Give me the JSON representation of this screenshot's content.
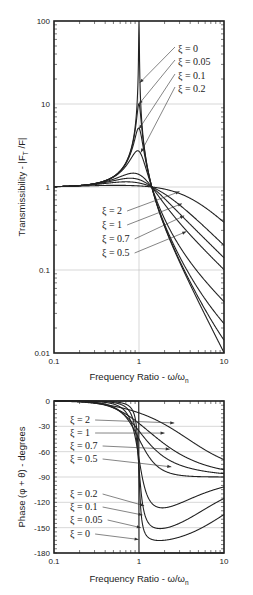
{
  "chart_data": [
    {
      "type": "line",
      "title": "",
      "xlabel": "Frequency Ratio - ω/ω",
      "xlabel_sub": "n",
      "ylabel": "Transmissibility - |F",
      "ylabel_sub": "T",
      "ylabel_tail": " /F|",
      "xscale": "log",
      "yscale": "log",
      "xlim": [
        0.1,
        10
      ],
      "ylim": [
        0.01,
        100
      ],
      "x_ticks": [
        0.1,
        1,
        10
      ],
      "x_tick_labels": [
        "0.1",
        "1",
        "10"
      ],
      "y_ticks": [
        0.01,
        0.1,
        1,
        10,
        100
      ],
      "y_tick_labels": [
        "0.01",
        "0.1",
        "1",
        "10",
        "100"
      ],
      "grid": true,
      "formula": "T = sqrt((1+(2ξr)^2)/((1-r^2)^2+(2ξr)^2))",
      "series": [
        {
          "name": "ξ = 0",
          "xi": 0
        },
        {
          "name": "ξ = 0.05",
          "xi": 0.05
        },
        {
          "name": "ξ = 0.1",
          "xi": 0.1
        },
        {
          "name": "ξ = 0.2",
          "xi": 0.2
        },
        {
          "name": "ξ = 0.5",
          "xi": 0.5
        },
        {
          "name": "ξ = 0.7",
          "xi": 0.7
        },
        {
          "name": "ξ = 1",
          "xi": 1
        },
        {
          "name": "ξ = 2",
          "xi": 2
        }
      ],
      "annotations": [
        {
          "text": "ξ = 0",
          "points_to": {
            "x": 1.02,
            "y": 18
          }
        },
        {
          "text": "ξ = 0.05",
          "points_to": {
            "x": 1.0,
            "y": 10
          }
        },
        {
          "text": "ξ = 0.1",
          "points_to": {
            "x": 1.0,
            "y": 5
          }
        },
        {
          "text": "ξ = 0.2",
          "points_to": {
            "x": 1.05,
            "y": 2.6
          }
        },
        {
          "text": "ξ = 2",
          "points_to": {
            "x": 3.0,
            "y": 0.88
          }
        },
        {
          "text": "ξ = 1",
          "points_to": {
            "x": 3.2,
            "y": 0.63
          }
        },
        {
          "text": "ξ = 0.7",
          "points_to": {
            "x": 3.4,
            "y": 0.45
          }
        },
        {
          "text": "ξ = 0.5",
          "points_to": {
            "x": 3.6,
            "y": 0.29
          }
        }
      ]
    },
    {
      "type": "line",
      "title": "",
      "xlabel": "Frequency Ratio - ω/ω",
      "xlabel_sub": "n",
      "ylabel": "Phase (φ + θ) - degrees",
      "xscale": "log",
      "yscale": "linear",
      "xlim": [
        0.1,
        10
      ],
      "ylim": [
        -180,
        0
      ],
      "x_ticks": [
        0.1,
        1,
        10
      ],
      "x_tick_labels": [
        "0.1",
        "1",
        "10"
      ],
      "y_ticks": [
        0,
        -30,
        -60,
        -90,
        -120,
        -150,
        -180
      ],
      "y_tick_labels": [
        "0",
        "-30",
        "-60",
        "-90",
        "-120",
        "-150",
        "-180"
      ],
      "grid": true,
      "formula": "phase = atan(2ξr) - atan2(2ξr, 1-r^2) (degrees)",
      "series": [
        {
          "name": "ξ = 2",
          "xi": 2
        },
        {
          "name": "ξ = 1",
          "xi": 1
        },
        {
          "name": "ξ = 0.7",
          "xi": 0.7
        },
        {
          "name": "ξ = 0.5",
          "xi": 0.5
        },
        {
          "name": "ξ = 0.2",
          "xi": 0.2
        },
        {
          "name": "ξ = 0.1",
          "xi": 0.1
        },
        {
          "name": "ξ = 0.05",
          "xi": 0.05
        },
        {
          "name": "ξ = 0",
          "xi": 0
        }
      ],
      "annotations": [
        {
          "text": "ξ = 2",
          "points_to": {
            "x": 2.6,
            "y": -26
          }
        },
        {
          "text": "ξ = 1",
          "points_to": {
            "x": 2.0,
            "y": -38
          }
        },
        {
          "text": "ξ = 0.7",
          "points_to": {
            "x": 2.3,
            "y": -57
          }
        },
        {
          "text": "ξ = 0.5",
          "points_to": {
            "x": 2.4,
            "y": -78
          }
        },
        {
          "text": "ξ = 0.2",
          "points_to": {
            "x": 1.15,
            "y": -124
          }
        },
        {
          "text": "ξ = 0.1",
          "points_to": {
            "x": 1.1,
            "y": -135
          }
        },
        {
          "text": "ξ = 0.05",
          "points_to": {
            "x": 1.05,
            "y": -150
          }
        },
        {
          "text": "ξ = 0",
          "points_to": {
            "x": 0.99,
            "y": -164
          }
        }
      ]
    }
  ]
}
